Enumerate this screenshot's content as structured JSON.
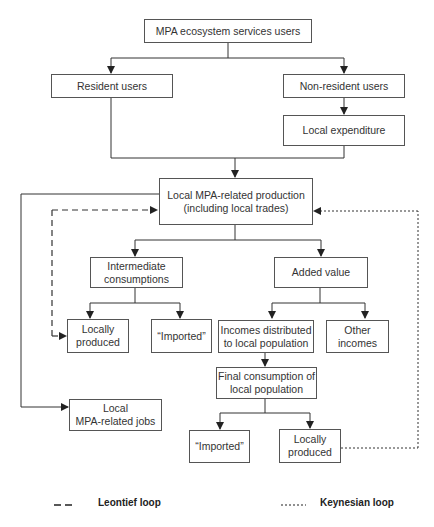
{
  "diagram": {
    "nodes": {
      "users": "MPA ecosystem services users",
      "resident": "Resident users",
      "non_resident": "Non-resident users",
      "local_expenditure": "Local expenditure",
      "production_line1": "Local MPA-related production",
      "production_line2": "(including local trades)",
      "intermediate_line1": "Intermediate",
      "intermediate_line2": "consumptions",
      "added_value": "Added value",
      "ic_local_line1": "Locally",
      "ic_local_line2": "produced",
      "ic_imported": "“Imported”",
      "incomes_line1": "Incomes distributed",
      "incomes_line2": "to local population",
      "other_incomes_line1": "Other",
      "other_incomes_line2": "incomes",
      "final_consumption_line1": "Final consumption of",
      "final_consumption_line2": "local population",
      "jobs_line1": "Local",
      "jobs_line2": "MPA-related jobs",
      "fc_imported": "“Imported”",
      "fc_local_line1": "Locally",
      "fc_local_line2": "produced"
    },
    "legend": {
      "leontief_symbol": "— —",
      "leontief_label": "Leontief loop",
      "keynesian_symbol": "------",
      "keynesian_label": "Keynesian loop"
    },
    "colors": {
      "line": "#222222",
      "box_border": "#555555"
    }
  }
}
